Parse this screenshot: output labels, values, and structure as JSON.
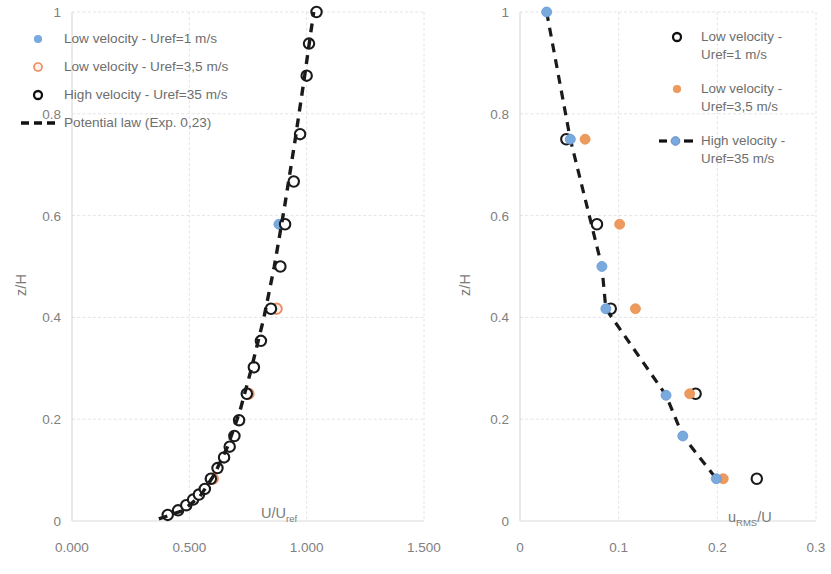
{
  "chart_data": [
    {
      "id": "mean-velocity-profile",
      "type": "scatter",
      "title": "",
      "xlabel": "U/Uref",
      "ylabel": "z/H",
      "xlim": [
        0,
        1.5
      ],
      "ylim": [
        0,
        1
      ],
      "xticks": [
        "0.000",
        "0.500",
        "1.000",
        "1.500"
      ],
      "xtick_values": [
        0,
        0.5,
        1.0,
        1.5
      ],
      "yticks": [
        "0",
        "0.2",
        "0.4",
        "0.6",
        "0.8",
        "1"
      ],
      "ytick_values": [
        0,
        0.2,
        0.4,
        0.6,
        0.8,
        1
      ],
      "grid": true,
      "legend_position": "top-left",
      "series": [
        {
          "name": "Low velocity - Uref=1 m/s",
          "marker": "filled-circle",
          "color": "#7aa9dd",
          "points": [
            {
              "x": 0.588,
              "y": 0.083
            },
            {
              "x": 0.742,
              "y": 0.25
            },
            {
              "x": 0.882,
              "y": 0.583
            }
          ]
        },
        {
          "name": "Low velocity - Uref=3,5 m/s",
          "marker": "open-circle",
          "color": "#ed8b62",
          "points": [
            {
              "x": 0.6,
              "y": 0.083
            },
            {
              "x": 0.752,
              "y": 0.25
            },
            {
              "x": 0.872,
              "y": 0.417
            }
          ]
        },
        {
          "name": "High velocity - Uref=35 m/s",
          "marker": "open-circle",
          "color": "#1a1a1a",
          "points": [
            {
              "x": 0.408,
              "y": 0.012
            },
            {
              "x": 0.452,
              "y": 0.021
            },
            {
              "x": 0.487,
              "y": 0.031
            },
            {
              "x": 0.516,
              "y": 0.042
            },
            {
              "x": 0.541,
              "y": 0.052
            },
            {
              "x": 0.566,
              "y": 0.063
            },
            {
              "x": 0.592,
              "y": 0.083
            },
            {
              "x": 0.62,
              "y": 0.104
            },
            {
              "x": 0.648,
              "y": 0.125
            },
            {
              "x": 0.672,
              "y": 0.146
            },
            {
              "x": 0.692,
              "y": 0.167
            },
            {
              "x": 0.712,
              "y": 0.198
            },
            {
              "x": 0.745,
              "y": 0.25
            },
            {
              "x": 0.775,
              "y": 0.302
            },
            {
              "x": 0.805,
              "y": 0.354
            },
            {
              "x": 0.848,
              "y": 0.417
            },
            {
              "x": 0.888,
              "y": 0.5
            },
            {
              "x": 0.908,
              "y": 0.583
            },
            {
              "x": 0.945,
              "y": 0.667
            },
            {
              "x": 0.972,
              "y": 0.76
            },
            {
              "x": 1.0,
              "y": 0.875
            },
            {
              "x": 1.01,
              "y": 0.938
            },
            {
              "x": 1.042,
              "y": 1.0
            }
          ]
        },
        {
          "name": "Potential law (Exp. 0,23)",
          "marker": "dashed-line",
          "color": "#1a1a1a",
          "points": [
            {
              "x": 0.37,
              "y": 0.004
            },
            {
              "x": 0.47,
              "y": 0.02
            },
            {
              "x": 0.545,
              "y": 0.048
            },
            {
              "x": 0.605,
              "y": 0.09
            },
            {
              "x": 0.662,
              "y": 0.145
            },
            {
              "x": 0.715,
              "y": 0.215
            },
            {
              "x": 0.762,
              "y": 0.295
            },
            {
              "x": 0.818,
              "y": 0.4
            },
            {
              "x": 0.862,
              "y": 0.5
            },
            {
              "x": 0.905,
              "y": 0.615
            },
            {
              "x": 0.948,
              "y": 0.74
            },
            {
              "x": 0.99,
              "y": 0.87
            },
            {
              "x": 1.03,
              "y": 1.0
            }
          ]
        }
      ]
    },
    {
      "id": "turbulence-intensity-profile",
      "type": "scatter",
      "title": "",
      "xlabel": "uRMS/U",
      "ylabel": "z/H",
      "xlim": [
        0,
        0.3
      ],
      "ylim": [
        0,
        1
      ],
      "xticks": [
        "0",
        "0.1",
        "0.2",
        "0.3"
      ],
      "xtick_values": [
        0,
        0.1,
        0.2,
        0.3
      ],
      "yticks": [
        "0",
        "0.2",
        "0.4",
        "0.6",
        "0.8",
        "1"
      ],
      "ytick_values": [
        0,
        0.2,
        0.4,
        0.6,
        0.8,
        1
      ],
      "grid": true,
      "legend_position": "top-right",
      "series": [
        {
          "name": "Low velocity - Uref=1 m/s",
          "marker": "open-circle",
          "color": "#1a1a1a",
          "points": [
            {
              "x": 0.047,
              "y": 0.75
            },
            {
              "x": 0.078,
              "y": 0.583
            },
            {
              "x": 0.092,
              "y": 0.417
            },
            {
              "x": 0.178,
              "y": 0.25
            },
            {
              "x": 0.24,
              "y": 0.083
            }
          ]
        },
        {
          "name": "Low velocity - Uref=3,5 m/s",
          "marker": "filled-circle",
          "color": "#ed9a5f",
          "points": [
            {
              "x": 0.066,
              "y": 0.75
            },
            {
              "x": 0.101,
              "y": 0.583
            },
            {
              "x": 0.117,
              "y": 0.417
            },
            {
              "x": 0.172,
              "y": 0.25
            },
            {
              "x": 0.206,
              "y": 0.083
            }
          ]
        },
        {
          "name": "High velocity - Uref=35 m/s",
          "marker": "filled-circle-dashed-line",
          "color": "#7aa9dd",
          "points": [
            {
              "x": 0.027,
              "y": 1.0
            },
            {
              "x": 0.051,
              "y": 0.75
            },
            {
              "x": 0.083,
              "y": 0.5
            },
            {
              "x": 0.087,
              "y": 0.417
            },
            {
              "x": 0.148,
              "y": 0.247
            },
            {
              "x": 0.165,
              "y": 0.167
            },
            {
              "x": 0.199,
              "y": 0.083
            }
          ]
        }
      ]
    }
  ],
  "left_chart": {
    "xlabel_main": "U/U",
    "xlabel_sub": "ref",
    "ylabel": "z/H",
    "legend": [
      {
        "label": "Low velocity - Uref=1 m/s",
        "key": "filled-blue-circle-marker"
      },
      {
        "label": "Low velocity - Uref=3,5 m/s",
        "key": "open-orange-circle-marker"
      },
      {
        "label": "High velocity - Uref=35 m/s",
        "key": "open-black-circle-marker"
      },
      {
        "label": "Potential law (Exp. 0,23)",
        "key": "dashed-black-line-marker"
      }
    ]
  },
  "right_chart": {
    "xlabel_main": "u",
    "xlabel_sub": "RMS",
    "xlabel_tail": "/U",
    "ylabel": "z/H",
    "legend": [
      {
        "label": "Low velocity -\nUref=1 m/s",
        "key": "open-black-circle-marker"
      },
      {
        "label": "Low velocity -\nUref=3,5 m/s",
        "key": "filled-orange-circle-marker"
      },
      {
        "label": "High velocity -\nUref=35 m/s",
        "key": "blue-circle-dashed-line-marker"
      }
    ]
  }
}
